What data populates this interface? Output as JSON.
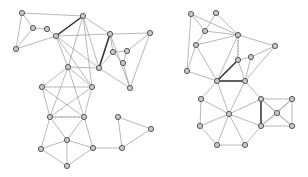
{
  "figure": {
    "title": "",
    "width": 308,
    "height": 177,
    "background_color": "#ffffff",
    "node_fill_color": "#c9c9c9",
    "node_stroke_color": "#4a4a4a",
    "edge_color": "#9a9a9a",
    "highlight_edge_color": "#2b2b2b",
    "dotted_edge_color": "#5a5a5a",
    "node_radius": 2.6
  },
  "graphs": [
    {
      "id": "left-graph",
      "name": "left-graph",
      "nodes": [
        {
          "id": "L0",
          "x": 22,
          "y": 13
        },
        {
          "id": "L1",
          "x": 33,
          "y": 28
        },
        {
          "id": "L2",
          "x": 47,
          "y": 29
        },
        {
          "id": "L3",
          "x": 16,
          "y": 49
        },
        {
          "id": "L4",
          "x": 56,
          "y": 36
        },
        {
          "id": "L5",
          "x": 83,
          "y": 16
        },
        {
          "id": "L6",
          "x": 110,
          "y": 34
        },
        {
          "id": "L7",
          "x": 150,
          "y": 33
        },
        {
          "id": "L8",
          "x": 113,
          "y": 52
        },
        {
          "id": "L9",
          "x": 127,
          "y": 51
        },
        {
          "id": "L10",
          "x": 123,
          "y": 63
        },
        {
          "id": "L11",
          "x": 99,
          "y": 68
        },
        {
          "id": "L12",
          "x": 130,
          "y": 88
        },
        {
          "id": "L13",
          "x": 68,
          "y": 67
        },
        {
          "id": "L14",
          "x": 42,
          "y": 87
        },
        {
          "id": "L15",
          "x": 92,
          "y": 87
        },
        {
          "id": "L16",
          "x": 50,
          "y": 117
        },
        {
          "id": "L17",
          "x": 84,
          "y": 117
        },
        {
          "id": "L18",
          "x": 67,
          "y": 140
        },
        {
          "id": "L19",
          "x": 41,
          "y": 149
        },
        {
          "id": "L20",
          "x": 67,
          "y": 166
        },
        {
          "id": "L21",
          "x": 93,
          "y": 148
        },
        {
          "id": "L22",
          "x": 122,
          "y": 148
        },
        {
          "id": "L23",
          "x": 118,
          "y": 117
        },
        {
          "id": "L24",
          "x": 151,
          "y": 129
        }
      ],
      "edges": [
        {
          "from": "L0",
          "to": "L1",
          "style": "normal"
        },
        {
          "from": "L0",
          "to": "L3",
          "style": "normal"
        },
        {
          "from": "L0",
          "to": "L5",
          "style": "normal"
        },
        {
          "from": "L1",
          "to": "L3",
          "style": "normal"
        },
        {
          "from": "L1",
          "to": "L2",
          "style": "normal"
        },
        {
          "from": "L2",
          "to": "L4",
          "style": "normal"
        },
        {
          "from": "L3",
          "to": "L4",
          "style": "normal"
        },
        {
          "from": "L4",
          "to": "L5",
          "style": "bold"
        },
        {
          "from": "L4",
          "to": "L6",
          "style": "normal"
        },
        {
          "from": "L4",
          "to": "L11",
          "style": "normal"
        },
        {
          "from": "L4",
          "to": "L13",
          "style": "normal"
        },
        {
          "from": "L4",
          "to": "L15",
          "style": "normal"
        },
        {
          "from": "L5",
          "to": "L6",
          "style": "normal"
        },
        {
          "from": "L5",
          "to": "L11",
          "style": "normal"
        },
        {
          "from": "L5",
          "to": "L13",
          "style": "normal"
        },
        {
          "from": "L5",
          "to": "L15",
          "style": "normal"
        },
        {
          "from": "L6",
          "to": "L7",
          "style": "normal"
        },
        {
          "from": "L6",
          "to": "L8",
          "style": "normal"
        },
        {
          "from": "L6",
          "to": "L11",
          "style": "bold"
        },
        {
          "from": "L6",
          "to": "L12",
          "style": "normal"
        },
        {
          "from": "L7",
          "to": "L9",
          "style": "normal"
        },
        {
          "from": "L7",
          "to": "L12",
          "style": "normal"
        },
        {
          "from": "L8",
          "to": "L9",
          "style": "normal"
        },
        {
          "from": "L8",
          "to": "L10",
          "style": "normal"
        },
        {
          "from": "L8",
          "to": "L11",
          "style": "normal"
        },
        {
          "from": "L9",
          "to": "L10",
          "style": "normal"
        },
        {
          "from": "L10",
          "to": "L12",
          "style": "normal"
        },
        {
          "from": "L11",
          "to": "L12",
          "style": "normal"
        },
        {
          "from": "L11",
          "to": "L13",
          "style": "normal"
        },
        {
          "from": "L13",
          "to": "L14",
          "style": "normal"
        },
        {
          "from": "L13",
          "to": "L15",
          "style": "normal"
        },
        {
          "from": "L13",
          "to": "L16",
          "style": "normal"
        },
        {
          "from": "L13",
          "to": "L17",
          "style": "normal"
        },
        {
          "from": "L14",
          "to": "L15",
          "style": "normal"
        },
        {
          "from": "L14",
          "to": "L16",
          "style": "normal"
        },
        {
          "from": "L14",
          "to": "L17",
          "style": "normal"
        },
        {
          "from": "L15",
          "to": "L16",
          "style": "normal"
        },
        {
          "from": "L15",
          "to": "L17",
          "style": "normal"
        },
        {
          "from": "L16",
          "to": "L17",
          "style": "dotted"
        },
        {
          "from": "L16",
          "to": "L18",
          "style": "normal"
        },
        {
          "from": "L16",
          "to": "L19",
          "style": "normal"
        },
        {
          "from": "L17",
          "to": "L18",
          "style": "normal"
        },
        {
          "from": "L17",
          "to": "L21",
          "style": "normal"
        },
        {
          "from": "L18",
          "to": "L19",
          "style": "normal"
        },
        {
          "from": "L18",
          "to": "L20",
          "style": "normal"
        },
        {
          "from": "L18",
          "to": "L21",
          "style": "normal"
        },
        {
          "from": "L19",
          "to": "L20",
          "style": "normal"
        },
        {
          "from": "L20",
          "to": "L21",
          "style": "normal"
        },
        {
          "from": "L21",
          "to": "L22",
          "style": "normal"
        },
        {
          "from": "L22",
          "to": "L23",
          "style": "normal"
        },
        {
          "from": "L22",
          "to": "L24",
          "style": "normal"
        },
        {
          "from": "L23",
          "to": "L24",
          "style": "normal"
        }
      ]
    },
    {
      "id": "right-graph",
      "name": "right-graph",
      "nodes": [
        {
          "id": "R0",
          "x": 191,
          "y": 14
        },
        {
          "id": "R1",
          "x": 216,
          "y": 13
        },
        {
          "id": "R2",
          "x": 205,
          "y": 31
        },
        {
          "id": "R3",
          "x": 238,
          "y": 35
        },
        {
          "id": "R4",
          "x": 196,
          "y": 45
        },
        {
          "id": "R5",
          "x": 275,
          "y": 46
        },
        {
          "id": "R6",
          "x": 238,
          "y": 60
        },
        {
          "id": "R7",
          "x": 251,
          "y": 57
        },
        {
          "id": "R8",
          "x": 187,
          "y": 71
        },
        {
          "id": "R9",
          "x": 217,
          "y": 81
        },
        {
          "id": "R10",
          "x": 245,
          "y": 81
        },
        {
          "id": "R11",
          "x": 201,
          "y": 99
        },
        {
          "id": "R12",
          "x": 229,
          "y": 114
        },
        {
          "id": "R13",
          "x": 261,
          "y": 99
        },
        {
          "id": "R14",
          "x": 200,
          "y": 126
        },
        {
          "id": "R15",
          "x": 261,
          "y": 126
        },
        {
          "id": "R16",
          "x": 217,
          "y": 145
        },
        {
          "id": "R17",
          "x": 245,
          "y": 145
        },
        {
          "id": "R18",
          "x": 292,
          "y": 99
        },
        {
          "id": "R19",
          "x": 292,
          "y": 126
        },
        {
          "id": "R20",
          "x": 277,
          "y": 113
        }
      ],
      "edges": [
        {
          "from": "R0",
          "to": "R2",
          "style": "normal"
        },
        {
          "from": "R0",
          "to": "R3",
          "style": "normal"
        },
        {
          "from": "R0",
          "to": "R8",
          "style": "normal"
        },
        {
          "from": "R1",
          "to": "R2",
          "style": "normal"
        },
        {
          "from": "R1",
          "to": "R3",
          "style": "normal"
        },
        {
          "from": "R2",
          "to": "R3",
          "style": "normal"
        },
        {
          "from": "R2",
          "to": "R4",
          "style": "normal"
        },
        {
          "from": "R3",
          "to": "R4",
          "style": "normal"
        },
        {
          "from": "R3",
          "to": "R5",
          "style": "normal"
        },
        {
          "from": "R3",
          "to": "R6",
          "style": "dotted"
        },
        {
          "from": "R3",
          "to": "R9",
          "style": "normal"
        },
        {
          "from": "R4",
          "to": "R8",
          "style": "normal"
        },
        {
          "from": "R4",
          "to": "R9",
          "style": "normal"
        },
        {
          "from": "R5",
          "to": "R7",
          "style": "normal"
        },
        {
          "from": "R5",
          "to": "R10",
          "style": "normal"
        },
        {
          "from": "R6",
          "to": "R7",
          "style": "normal"
        },
        {
          "from": "R6",
          "to": "R9",
          "style": "dotted"
        },
        {
          "from": "R6",
          "to": "R10",
          "style": "normal"
        },
        {
          "from": "R7",
          "to": "R10",
          "style": "normal"
        },
        {
          "from": "R8",
          "to": "R9",
          "style": "normal"
        },
        {
          "from": "R9",
          "to": "R6",
          "style": "bold"
        },
        {
          "from": "R9",
          "to": "R10",
          "style": "bold"
        },
        {
          "from": "R9",
          "to": "R11",
          "style": "normal"
        },
        {
          "from": "R9",
          "to": "R12",
          "style": "normal"
        },
        {
          "from": "R10",
          "to": "R12",
          "style": "normal"
        },
        {
          "from": "R10",
          "to": "R13",
          "style": "normal"
        },
        {
          "from": "R11",
          "to": "R12",
          "style": "normal"
        },
        {
          "from": "R11",
          "to": "R14",
          "style": "normal"
        },
        {
          "from": "R12",
          "to": "R13",
          "style": "normal"
        },
        {
          "from": "R12",
          "to": "R14",
          "style": "normal"
        },
        {
          "from": "R12",
          "to": "R15",
          "style": "normal"
        },
        {
          "from": "R12",
          "to": "R16",
          "style": "normal"
        },
        {
          "from": "R12",
          "to": "R17",
          "style": "normal"
        },
        {
          "from": "R13",
          "to": "R15",
          "style": "bold"
        },
        {
          "from": "R13",
          "to": "R18",
          "style": "normal"
        },
        {
          "from": "R13",
          "to": "R19",
          "style": "normal"
        },
        {
          "from": "R13",
          "to": "R20",
          "style": "normal"
        },
        {
          "from": "R14",
          "to": "R16",
          "style": "normal"
        },
        {
          "from": "R15",
          "to": "R17",
          "style": "normal"
        },
        {
          "from": "R15",
          "to": "R18",
          "style": "normal"
        },
        {
          "from": "R15",
          "to": "R19",
          "style": "normal"
        },
        {
          "from": "R15",
          "to": "R20",
          "style": "normal"
        },
        {
          "from": "R16",
          "to": "R17",
          "style": "normal"
        },
        {
          "from": "R18",
          "to": "R19",
          "style": "normal"
        },
        {
          "from": "R18",
          "to": "R20",
          "style": "normal"
        },
        {
          "from": "R19",
          "to": "R20",
          "style": "normal"
        }
      ]
    }
  ]
}
